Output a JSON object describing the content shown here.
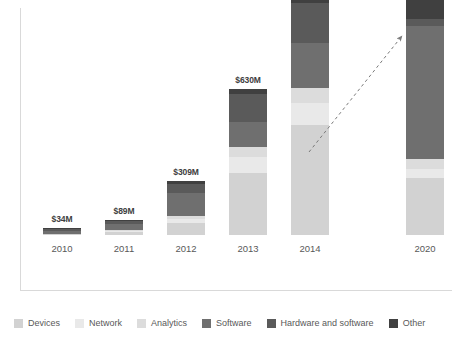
{
  "chart_data": {
    "type": "bar",
    "subtype": "stacked-bar",
    "title": "",
    "subtitle": "",
    "xlabel": "",
    "ylabel": "",
    "grid": false,
    "legend_position": "bottom",
    "categories": [
      "2010",
      "2011",
      "2012",
      "2013",
      "2014",
      "2020"
    ],
    "bar_labels": [
      "$34M",
      "$89M",
      "$309M",
      "$630M",
      "$976M",
      "$9B"
    ],
    "series": [
      {
        "name": "Devices",
        "color": "#d2d2d2",
        "values": [
          1,
          3,
          12,
          62,
          110,
          57
        ]
      },
      {
        "name": "Network",
        "color": "#e9e9e9",
        "values": [
          0,
          1,
          4,
          16,
          22,
          9
        ]
      },
      {
        "name": "Analytics",
        "color": "#dcdcdc",
        "values": [
          0,
          1,
          3,
          10,
          15,
          10
        ]
      },
      {
        "name": "Software",
        "color": "#6f6f6f",
        "values": [
          3,
          6,
          23,
          25,
          45,
          133
        ]
      },
      {
        "name": "Hardware and software",
        "color": "#5a5a5a",
        "values": [
          2,
          3,
          9,
          28,
          40,
          7
        ]
      },
      {
        "name": "Other",
        "color": "#404040",
        "values": [
          1,
          1,
          3,
          5,
          16,
          41
        ]
      }
    ],
    "annotation": {
      "type": "dashed-arrow",
      "from": "2014",
      "to": "2020",
      "label": ""
    }
  },
  "legend": {
    "items": [
      {
        "label": "Devices",
        "color": "#d2d2d2"
      },
      {
        "label": "Network",
        "color": "#e9e9e9"
      },
      {
        "label": "Analytics",
        "color": "#dcdcdc"
      },
      {
        "label": "Software",
        "color": "#6f6f6f"
      },
      {
        "label": "Hardware and software",
        "color": "#5a5a5a"
      },
      {
        "label": "Other",
        "color": "#404040"
      }
    ]
  }
}
